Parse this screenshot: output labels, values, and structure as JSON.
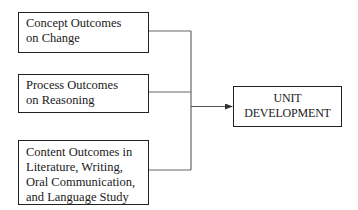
{
  "diagram": {
    "type": "flow-convergence",
    "inputs": [
      {
        "id": "concept",
        "lines": [
          "Concept Outcomes",
          "on Change"
        ]
      },
      {
        "id": "process",
        "lines": [
          "Process Outcomes",
          "on Reasoning"
        ]
      },
      {
        "id": "content",
        "lines": [
          "Content Outcomes in",
          "Literature, Writing,",
          "Oral Communication,",
          "and Language Study"
        ]
      }
    ],
    "output": {
      "id": "unit",
      "lines": [
        "UNIT",
        "DEVELOPMENT"
      ]
    },
    "edges": [
      {
        "from": "concept",
        "to": "unit"
      },
      {
        "from": "process",
        "to": "unit"
      },
      {
        "from": "content",
        "to": "unit"
      }
    ],
    "colors": {
      "box_border": "#222222",
      "connector": "#666666",
      "text": "#1a1a1a",
      "background": "#ffffff"
    }
  }
}
